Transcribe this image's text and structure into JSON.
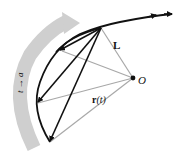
{
  "diagram": {
    "labels": {
      "L": "L",
      "O": "O",
      "r": "r",
      "r_arg": "(t)",
      "limit": "t → a"
    },
    "colors": {
      "curve": "#111111",
      "chord": "#111111",
      "radius": "#a8a8a8",
      "band": "#c9c9c9",
      "point": "#111111"
    },
    "points": {
      "O": [
        133,
        78
      ],
      "P": [
        101,
        28
      ]
    }
  }
}
